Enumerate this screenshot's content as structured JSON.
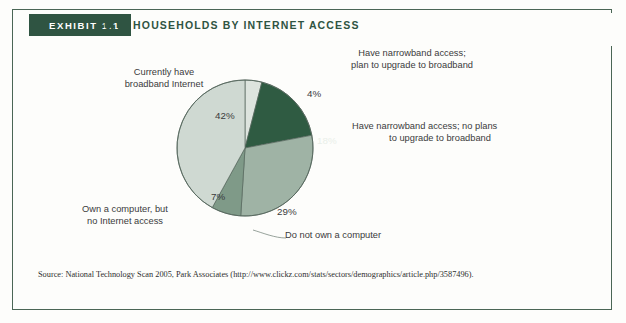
{
  "exhibit": {
    "tab_label": "EXHIBIT 1.1",
    "title": "U.S. HOUSEHOLDS BY INTERNET ACCESS"
  },
  "colors": {
    "frame_border": "#4a6655",
    "tab_background": "#2f5442",
    "tab_text": "#ffffff",
    "title_text": "#2f5442",
    "page_background": "#fdfdfb",
    "label_text": "#3b3b3b",
    "slice_broadband": "#cfd9d2",
    "slice_narrowband_upgrade": "#dde4de",
    "slice_narrowband_noplan": "#2f5b42",
    "slice_no_computer": "#9fb3a5",
    "slice_own_computer_no_internet": "#7f9a88",
    "pie_outline": "#55665c"
  },
  "labels": {
    "broadband": "Currently have\nbroadband Internet",
    "broadband_line1": "Currently have",
    "broadband_line2": "broadband Internet",
    "narrowband_upgrade_line1": "Have narrowband access;",
    "narrowband_upgrade_line2": "plan to upgrade to broadband",
    "narrowband_noplan_line1": "Have narrowband access; no plans",
    "narrowband_noplan_line2": "to upgrade to broadband",
    "own_computer_line1": "Own a computer, but",
    "own_computer_line2": "no Internet access",
    "no_computer": "Do not own a computer"
  },
  "percent_labels": {
    "broadband": "42%",
    "narrowband_upgrade": "4%",
    "narrowband_noplan": "18%",
    "no_computer": "29%",
    "own_computer_no_internet": "7%"
  },
  "source": {
    "text": "Source: National Technology Scan 2005, Park Associates (http://www.clickz.com/stats/sectors/demographics/article.php/3587496)."
  },
  "chart_data": {
    "type": "pie",
    "title": "U.S. HOUSEHOLDS BY INTERNET ACCESS",
    "xlabel": "",
    "ylabel": "",
    "grid": false,
    "legend_position": "callout-labels",
    "total": 100,
    "units": "percent of U.S. households",
    "start_angle_deg": 0,
    "direction": "clockwise",
    "slices": [
      {
        "label": "Have narrowband access; plan to upgrade to broadband",
        "value": 4,
        "display": "4%",
        "color": "#dde4de",
        "start_deg": 0,
        "end_deg": 14.4
      },
      {
        "label": "Have narrowband access; no plans to upgrade to broadband",
        "value": 18,
        "display": "18%",
        "color": "#2f5b42",
        "start_deg": 14.4,
        "end_deg": 79.2
      },
      {
        "label": "Do not own a computer",
        "value": 29,
        "display": "29%",
        "color": "#9fb3a5",
        "start_deg": 79.2,
        "end_deg": 183.6
      },
      {
        "label": "Own a computer, but no Internet access",
        "value": 7,
        "display": "7%",
        "color": "#7f9a88",
        "start_deg": 183.6,
        "end_deg": 208.8
      },
      {
        "label": "Currently have broadband Internet",
        "value": 42,
        "display": "42%",
        "color": "#cfd9d2",
        "start_deg": 208.8,
        "end_deg": 360
      }
    ]
  }
}
